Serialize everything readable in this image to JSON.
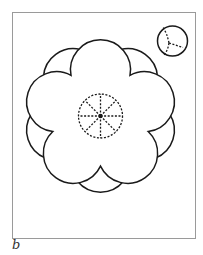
{
  "figure": {
    "panel_label": "b",
    "frame": {
      "x": 12,
      "y": 12,
      "width": 183,
      "height": 226
    },
    "main_structure": {
      "center": [
        100.5,
        116
      ],
      "outer_ring": {
        "lobes": 5,
        "lobe_radius": 30,
        "lobe_offset": 35,
        "rotation_deg": 36
      },
      "inner_flower": {
        "lobes": 5,
        "lobe_radius": 30,
        "lobe_offset": 35,
        "rotation_deg": 0
      },
      "central_disc": {
        "radius": 22,
        "style": "dashed",
        "spokes": 8
      }
    },
    "inset_circle": {
      "center": [
        172.5,
        41
      ],
      "radius": 15,
      "dashed_branches": 3
    },
    "colors": {
      "line": "#1a1a1a",
      "frame": "#9a9a9a",
      "background": "#ffffff"
    }
  }
}
